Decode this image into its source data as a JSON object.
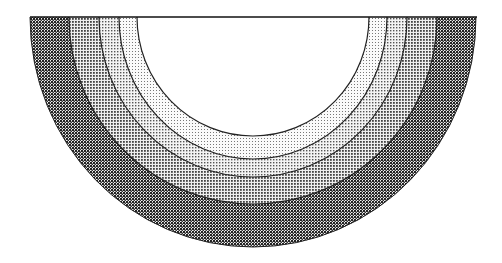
{
  "diagram": {
    "type": "concentric-semicircle",
    "center": {
      "x": 253,
      "y": 17
    },
    "bands": [
      {
        "name": "outer-band",
        "rx": 223,
        "ry": 230,
        "pattern": "dense-dark",
        "shade": "#3a3a3a"
      },
      {
        "name": "band-3",
        "rx": 184,
        "ry": 187,
        "pattern": "medium-dark",
        "shade": "#8a8a8a"
      },
      {
        "name": "band-2",
        "rx": 154,
        "ry": 160,
        "pattern": "medium",
        "shade": "#a8a8a8"
      },
      {
        "name": "band-1",
        "rx": 134,
        "ry": 142,
        "pattern": "light",
        "shade": "#c8c8c8"
      },
      {
        "name": "inner-hole",
        "rx": 116,
        "ry": 119,
        "pattern": "none",
        "shade": "#ffffff"
      }
    ],
    "baseline": {
      "x1": 30,
      "x2": 477,
      "y": 17
    }
  }
}
